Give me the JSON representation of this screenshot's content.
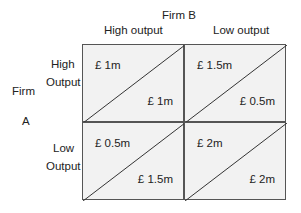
{
  "firm_b": {
    "label": "Firm B",
    "columns": [
      "High output",
      "Low output"
    ]
  },
  "firm_a": {
    "label_line1": "Firm",
    "label_line2": "A",
    "rows": [
      [
        "High",
        "Output"
      ],
      [
        "Low",
        "Output"
      ]
    ]
  },
  "payoffs": [
    [
      {
        "a": "£ 1m",
        "b": "£ 1m"
      },
      {
        "a": "£ 1.5m",
        "b": "£ 0.5m"
      }
    ],
    [
      {
        "a": "£ 0.5m",
        "b": "£ 1.5m"
      },
      {
        "a": "£ 2m",
        "b": "£ 2m"
      }
    ]
  ]
}
